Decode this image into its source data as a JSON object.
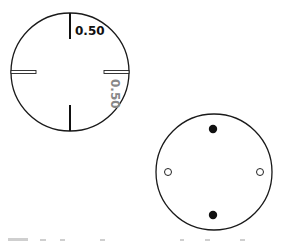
{
  "diagram": {
    "top_gauge": {
      "label_top": "0.50",
      "label_right": "0.50",
      "label_top_color": "#111111",
      "label_right_color": "#888888"
    },
    "bottom_dial": {
      "filled_dots": [
        "top",
        "bottom"
      ],
      "hollow_dots": [
        "left",
        "right"
      ]
    },
    "caption": ""
  }
}
